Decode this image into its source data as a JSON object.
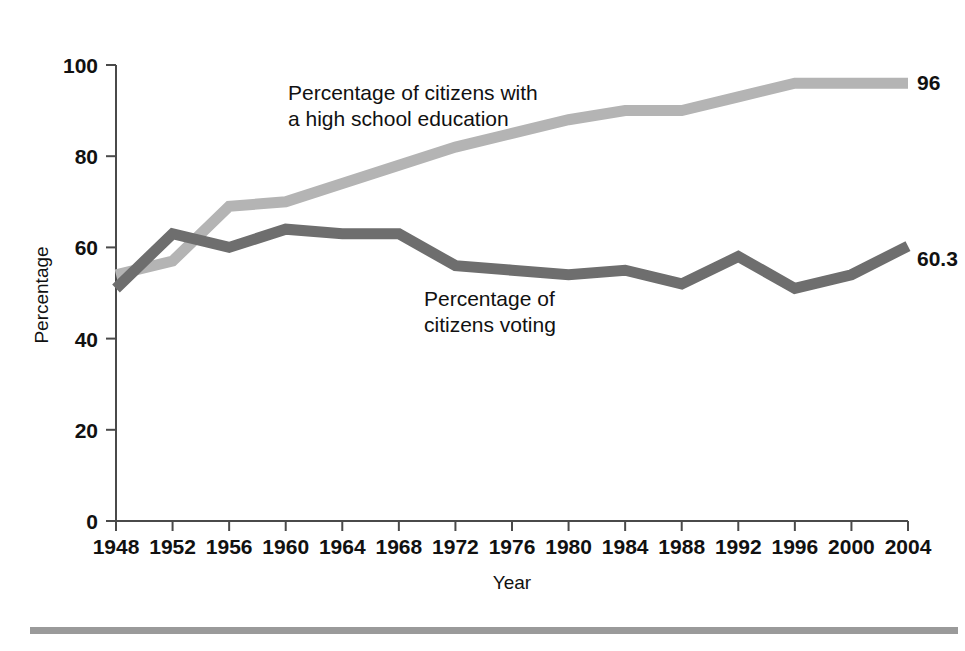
{
  "chart_data": {
    "type": "line",
    "title": "",
    "xlabel": "Year",
    "ylabel": "Percentage",
    "xlim": [
      1948,
      2004
    ],
    "ylim": [
      0,
      100
    ],
    "grid": false,
    "legend_position": "inline-annotations",
    "categories": [
      1948,
      1952,
      1956,
      1960,
      1964,
      1968,
      1972,
      1976,
      1980,
      1984,
      1988,
      1992,
      1996,
      2000,
      2004
    ],
    "xticklabels": [
      "1948",
      "1952",
      "1956",
      "1960",
      "1964",
      "1968",
      "1972",
      "1976",
      "1980",
      "1984",
      "1988",
      "1992",
      "1996",
      "2000",
      "2004"
    ],
    "yticks": [
      0,
      20,
      40,
      60,
      80,
      100
    ],
    "yticklabels": [
      "0",
      "20",
      "40",
      "60",
      "80",
      "100"
    ],
    "series": [
      {
        "name": "Percentage of citizens with a high school education",
        "color": "#b4b4b4",
        "values": [
          54,
          57,
          69,
          70,
          74,
          78,
          82,
          85,
          88,
          90,
          90,
          93,
          96,
          96,
          96
        ],
        "end_label": "96"
      },
      {
        "name": "Percentage of citizens voting",
        "color": "#6e6e6e",
        "values": [
          51,
          63,
          60,
          64,
          63,
          63,
          56,
          55,
          54,
          55,
          52,
          58,
          51,
          54,
          60.3
        ],
        "end_label": "60.3"
      }
    ],
    "annotations": [
      {
        "name": "education-annotation",
        "lines": [
          "Percentage of citizens with",
          "a high school education"
        ],
        "x_px": 288,
        "y_px": 100
      },
      {
        "name": "voting-annotation",
        "lines": [
          "Percentage of",
          "citizens voting"
        ],
        "x_px": 424,
        "y_px": 306
      }
    ]
  },
  "colors": {
    "education_line": "#b4b4b4",
    "voting_line": "#6e6e6e",
    "axis": "#4a4a4a",
    "rule": "#9a9a9a",
    "text": "#111111",
    "background": "#ffffff"
  }
}
